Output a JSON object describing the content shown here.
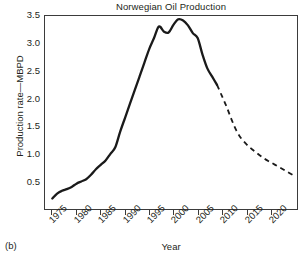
{
  "figure": {
    "panel_label": "(b)"
  },
  "chart_data": {
    "type": "line",
    "title": "Norwegian Oil Production",
    "xlabel": "Year",
    "ylabel": "Production rate—MBPD",
    "xlim": [
      1973.5,
      2025.5
    ],
    "ylim": [
      0.0,
      3.5
    ],
    "grid": false,
    "legend": null,
    "xticks": [
      1975,
      1980,
      1985,
      1990,
      1995,
      2000,
      2005,
      2010,
      2015,
      2020
    ],
    "xtick_labels": [
      "1975",
      "1980",
      "1985",
      "1990",
      "1995",
      "2000",
      "2005",
      "2010",
      "2015",
      "2020"
    ],
    "yticks": [
      0.5,
      1.0,
      1.5,
      2.0,
      2.5,
      3.0,
      3.5
    ],
    "ytick_labels": [
      "0.5",
      "1.0",
      "1.5",
      "2.0",
      "2.5",
      "3.0",
      "3.5"
    ],
    "series": [
      {
        "name": "Historical production",
        "style": "solid",
        "color": "#1a1a1a",
        "x": [
          1975,
          1976,
          1977,
          1978,
          1979,
          1980,
          1981,
          1982,
          1983,
          1984,
          1985,
          1986,
          1987,
          1988,
          1989,
          1990,
          1991,
          1992,
          1993,
          1994,
          1995,
          1996,
          1997,
          1998,
          1999,
          2000,
          2001,
          2002,
          2003,
          2004,
          2005,
          2006,
          2007,
          2008,
          2009
        ],
        "y": [
          0.19,
          0.28,
          0.33,
          0.36,
          0.4,
          0.46,
          0.5,
          0.54,
          0.62,
          0.72,
          0.8,
          0.88,
          1.0,
          1.12,
          1.4,
          1.65,
          1.9,
          2.15,
          2.4,
          2.65,
          2.9,
          3.1,
          3.31,
          3.22,
          3.2,
          3.34,
          3.44,
          3.42,
          3.33,
          3.19,
          3.1,
          2.8,
          2.55,
          2.4,
          2.25
        ]
      },
      {
        "name": "Projected production",
        "style": "dashed",
        "color": "#1a1a1a",
        "x": [
          2009,
          2010,
          2011,
          2012,
          2013,
          2014,
          2015,
          2016,
          2017,
          2018,
          2019,
          2020,
          2021,
          2022,
          2023,
          2024,
          2025
        ],
        "y": [
          2.25,
          2.05,
          1.85,
          1.62,
          1.42,
          1.28,
          1.18,
          1.1,
          1.03,
          0.96,
          0.9,
          0.85,
          0.8,
          0.75,
          0.7,
          0.65,
          0.6
        ]
      }
    ]
  }
}
